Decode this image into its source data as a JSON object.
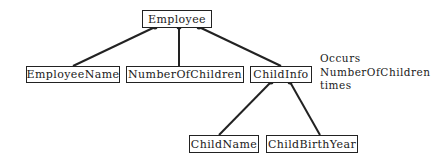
{
  "diagram": {
    "type": "hierarchy",
    "nodes": {
      "root": {
        "label": "Employee"
      },
      "employee_name": {
        "label": "EmployeeName"
      },
      "number_of_children": {
        "label": "NumberOfChildren"
      },
      "child_info": {
        "label": "ChildInfo"
      },
      "child_name": {
        "label": "ChildName"
      },
      "child_birth_year": {
        "label": "ChildBirthYear"
      }
    },
    "edges": [
      {
        "from": "Employee",
        "to": "EmployeeName"
      },
      {
        "from": "Employee",
        "to": "NumberOfChildren"
      },
      {
        "from": "Employee",
        "to": "ChildInfo"
      },
      {
        "from": "ChildInfo",
        "to": "ChildName"
      },
      {
        "from": "ChildInfo",
        "to": "ChildBirthYear"
      }
    ],
    "annotation": {
      "line1": "Occurs",
      "line2": "NumberOfChildren",
      "line3": "times"
    },
    "colors": {
      "stroke": "#222222",
      "background": "#ffffff"
    }
  }
}
